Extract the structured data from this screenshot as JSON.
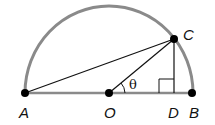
{
  "diagram": {
    "type": "semicircle-geometry",
    "colors": {
      "arc": "#8a8a8a",
      "diameter": "#8a8a8a",
      "segments": "#111111",
      "points": "#000000"
    },
    "points": [
      {
        "label": "A",
        "x": 25,
        "y": 93
      },
      {
        "label": "O",
        "x": 109,
        "y": 93
      },
      {
        "label": "D",
        "x": 174,
        "y": 93
      },
      {
        "label": "B",
        "x": 192,
        "y": 93
      },
      {
        "label": "C",
        "x": 174,
        "y": 39
      }
    ],
    "labels": {
      "A": "A",
      "O": "O",
      "D": "D",
      "B": "B",
      "C": "C",
      "angle": "θ"
    },
    "segments": [
      "AC",
      "OC",
      "CD",
      "AB"
    ],
    "right_angle_at": "D",
    "angle_marked": "COD"
  }
}
